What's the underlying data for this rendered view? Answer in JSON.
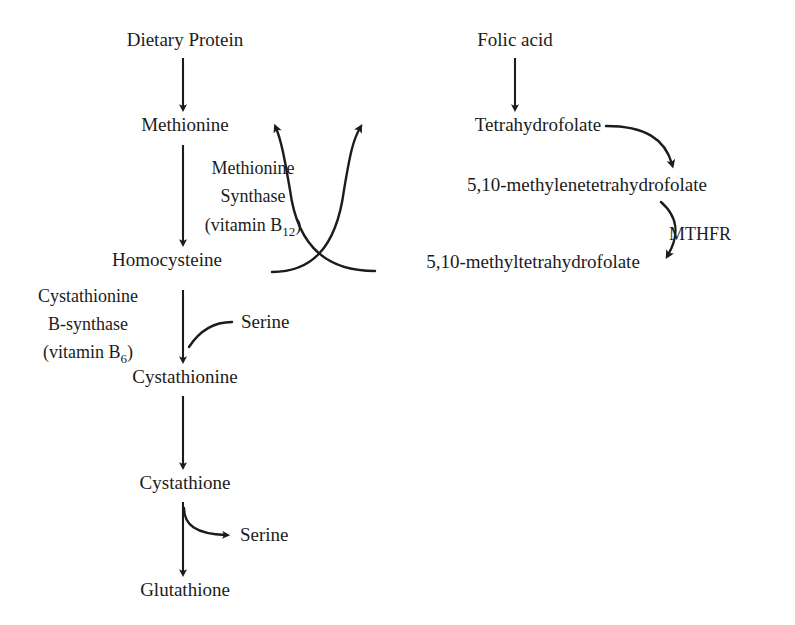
{
  "figure": {
    "kind": "biochemical-pathway-diagram",
    "background_color": "#ffffff",
    "ink_color": "#1c1c20"
  },
  "nodes": {
    "dietary_protein": {
      "label": "Dietary Protein",
      "x": 185,
      "y": 46
    },
    "methionine": {
      "label": "Methionine",
      "x": 185,
      "y": 131
    },
    "homocysteine": {
      "label": "Homocysteine",
      "x": 167,
      "y": 266
    },
    "cystathionine": {
      "label": "Cystathionine",
      "x": 185,
      "y": 383
    },
    "cystathione": {
      "label": "Cystathione",
      "x": 185,
      "y": 489
    },
    "glutathione": {
      "label": "Glutathione",
      "x": 185,
      "y": 596
    },
    "folic_acid": {
      "label": "Folic acid",
      "x": 515,
      "y": 46
    },
    "tetrahydrofolate": {
      "label": "Tetrahydrofolate",
      "x": 538,
      "y": 131
    },
    "methylene_thf": {
      "label": "5,10-methylenetetrahydrofolate",
      "x": 587,
      "y": 191
    },
    "methyl_thf": {
      "label": "5,10-methyltetrahydrofolate",
      "x": 533,
      "y": 268
    }
  },
  "enzymes": {
    "methionine_synthase": {
      "line1": "Methionine",
      "line2": "Synthase",
      "cofactor_prefix": "(vitamin B",
      "cofactor_sub": "12",
      "cofactor_suffix": ")",
      "x": 253,
      "y": 174
    },
    "cystathionine_b_synthase": {
      "line1": "Cystathionine",
      "line2": "B-synthase",
      "cofactor_prefix": "(vitamin B",
      "cofactor_sub": "6",
      "cofactor_suffix": ")",
      "x": 88,
      "y": 302
    },
    "mthfr": {
      "label": "MTHFR",
      "x": 700,
      "y": 240
    }
  },
  "cosubstrates": {
    "serine_in": {
      "label": "Serine",
      "x": 241,
      "y": 328
    },
    "serine_out": {
      "label": "Serine",
      "x": 240,
      "y": 541
    }
  },
  "reactions": [
    {
      "name": "protein-to-methionine",
      "from": "dietary_protein",
      "to": "methionine",
      "style": "straight-down"
    },
    {
      "name": "methionine-to-homocysteine",
      "from": "methionine",
      "to": "homocysteine",
      "style": "straight-down"
    },
    {
      "name": "homocysteine-to-cystathionine",
      "from": "homocysteine",
      "to": "cystathionine",
      "style": "straight-down"
    },
    {
      "name": "cystathionine-to-cystathione",
      "from": "cystathionine",
      "to": "cystathione",
      "style": "straight-down"
    },
    {
      "name": "cystathione-to-glutathione",
      "from": "cystathione",
      "to": "glutathione",
      "style": "straight-down"
    },
    {
      "name": "folic-acid-to-tetrahydrofolate",
      "from": "folic_acid",
      "to": "tetrahydrofolate",
      "style": "straight-down"
    },
    {
      "name": "methylthf-to-methionine",
      "from": "methyl_thf",
      "to": "methionine",
      "style": "curve-left-up"
    },
    {
      "name": "homocysteine-to-tetrahydrofolate",
      "from": "homocysteine",
      "to": "tetrahydrofolate",
      "style": "curve-right-up"
    },
    {
      "name": "tetrahydrofolate-to-methylene",
      "from": "tetrahydrofolate",
      "to": "methylene_thf",
      "style": "curve-right-down"
    },
    {
      "name": "methylene-to-methylthf",
      "from": "methylene_thf",
      "to": "methyl_thf",
      "style": "curve-mthfr"
    },
    {
      "name": "serine-input",
      "to": "cystathionine",
      "style": "curve-in"
    },
    {
      "name": "serine-output",
      "from": "cystathione",
      "style": "curve-out"
    }
  ]
}
